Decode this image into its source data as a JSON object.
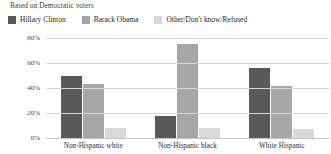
{
  "subtitle": "Based on Democratic voters",
  "legend": {
    "entries": [
      {
        "label": "Hillary Clinton",
        "color": "#595959"
      },
      {
        "label": "Barack Obama",
        "color": "#a6a6a6"
      },
      {
        "label": "Other/Don't know/Refused",
        "color": "#d9d9d9"
      }
    ]
  },
  "chart_data": {
    "type": "bar",
    "title": "",
    "subtitle": "Based on Democratic voters",
    "xlabel": "",
    "ylabel": "",
    "categories": [
      "Non-Hispanic white",
      "Non-Hispanic black",
      "White Hispanic"
    ],
    "series": [
      {
        "name": "Hillary Clinton",
        "color": "#595959",
        "values": [
          50,
          18,
          56
        ]
      },
      {
        "name": "Barack Obama",
        "color": "#a6a6a6",
        "values": [
          43,
          75,
          42
        ]
      },
      {
        "name": "Other/Don't know/Refused",
        "color": "#d9d9d9",
        "values": [
          8,
          8,
          7
        ]
      }
    ],
    "ylim": [
      0,
      80
    ],
    "yticks": [
      0,
      20,
      40,
      60,
      80
    ],
    "ytick_labels": [
      "0%",
      "20%",
      "40%",
      "60%",
      "80%"
    ],
    "grid": true,
    "legend_position": "top-left"
  }
}
